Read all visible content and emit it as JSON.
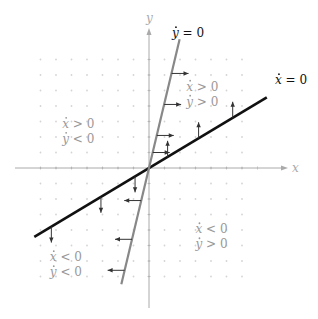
{
  "figure": {
    "type": "phase-plane-nullcline-diagram",
    "axes": {
      "x_label": "x",
      "y_label": "y",
      "x_range": [
        -8,
        8
      ],
      "y_range": [
        -8,
        8
      ]
    },
    "nullclines": [
      {
        "id": "x-dot-zero",
        "label": "ẋ = 0",
        "label_base": "x",
        "label_rest": " = 0",
        "slope": 0.6,
        "color": "#111111",
        "arrow_direction": "vertical",
        "arrow_points_x": [
          -6.3,
          -3.1,
          -0.9,
          1.2,
          3.2,
          5.4
        ]
      },
      {
        "id": "y-dot-zero",
        "label": "ẏ = 0",
        "label_base": "y",
        "label_rest": " = 0",
        "slope": 4.2,
        "color": "#888888",
        "arrow_direction": "horizontal",
        "arrow_points_y": [
          -6.6,
          -4.6,
          -2.1,
          1.0,
          2.1,
          4.1,
          6.1
        ]
      }
    ],
    "regions": [
      {
        "id": "upper-right",
        "line1": "ẋ > 0",
        "line2": "ẏ > 0",
        "x1": "x",
        "op1": " > 0",
        "x2": "y",
        "op2": " > 0",
        "pos": [
          2.4,
          5.0
        ]
      },
      {
        "id": "upper-left",
        "line1": "ẋ > 0",
        "line2": "ẏ < 0",
        "x1": "x",
        "op1": " > 0",
        "x2": "y",
        "op2": " < 0",
        "pos": [
          -5.6,
          2.6
        ]
      },
      {
        "id": "lower-right",
        "line1": "ẋ < 0",
        "line2": "ẏ > 0",
        "x1": "x",
        "op1": " < 0",
        "x2": "y",
        "op2": " > 0",
        "pos": [
          3.0,
          -4.2
        ]
      },
      {
        "id": "lower-left",
        "line1": "ẋ < 0",
        "line2": "ẏ < 0",
        "x1": "x",
        "op1": " < 0",
        "x2": "y",
        "op2": " < 0",
        "pos": [
          -6.4,
          -6.0
        ]
      }
    ],
    "colors": {
      "axis": "#aaaaaa",
      "grid_dots": "#d4d4d4",
      "region_text": "#999999",
      "nullcline_label": "#111111"
    }
  }
}
